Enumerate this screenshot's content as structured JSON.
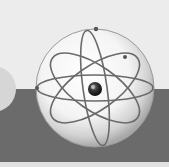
{
  "image": {
    "subject": "atom-in-sphere",
    "colors": {
      "background_top": "#ececec",
      "background_band": "#6b6b6b",
      "background_bottom": "#e2e2e2",
      "sphere_light": "#ffffff",
      "sphere_shadow": "#b5b5b5",
      "orbit": "#6a6a6a",
      "nucleus": "#222222"
    }
  }
}
